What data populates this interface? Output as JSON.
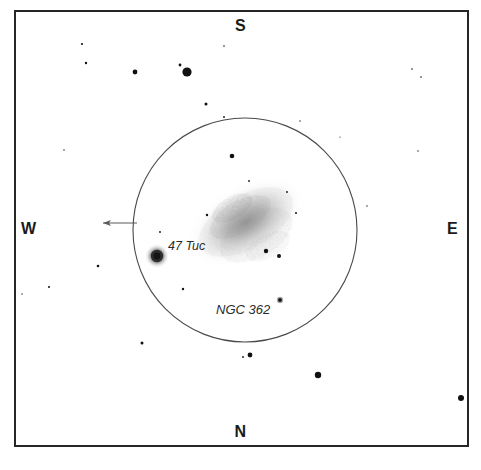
{
  "chart": {
    "type": "finder-chart",
    "background_color": "#ffffff",
    "ink_color": "#1a1a1a"
  },
  "frame": {
    "name": "chart-border",
    "x": 15,
    "y": 11,
    "width": 453,
    "height": 435,
    "stroke": "#262626",
    "stroke_width": 2
  },
  "cardinals": {
    "south": "S",
    "north": "N",
    "west": "W",
    "east": "E"
  },
  "fov_circle": {
    "name": "field-of-view-circle",
    "cx": 245,
    "cy": 230,
    "r": 112,
    "stroke": "#4a4a4a",
    "stroke_width": 1.1
  },
  "pointer_arrow": {
    "name": "west-direction-arrow",
    "x1": 137,
    "y1": 223,
    "x2": 101,
    "y2": 223,
    "stroke": "#5a5a5a",
    "stroke_width": 1.2
  },
  "labels": {
    "cluster_47tuc": "47 Tuc",
    "cluster_ngc362": "NGC 362"
  },
  "deep_sky_objects": [
    {
      "name": "47 Tuc",
      "cx": 157,
      "cy": 256,
      "r": 11,
      "kind": "globular-cluster"
    },
    {
      "name": "NGC 362",
      "cx": 280,
      "cy": 300,
      "r": 2.4,
      "kind": "globular-cluster"
    },
    {
      "name": "Small Magellanic Cloud",
      "cx": 246,
      "cy": 222,
      "rx": 62,
      "ry": 33,
      "angle": -30,
      "kind": "galaxy"
    }
  ],
  "chart_data": {
    "type": "scatter",
    "xlabel": "",
    "ylabel": "",
    "xlim": [
      15,
      468
    ],
    "ylim": [
      11,
      446
    ],
    "grid": false,
    "legend": "none",
    "annotations": [
      {
        "text": "S",
        "x": 241,
        "y": 26
      },
      {
        "text": "N",
        "x": 241,
        "y": 431
      },
      {
        "text": "W",
        "x": 28,
        "y": 228
      },
      {
        "text": "E",
        "x": 453,
        "y": 228
      },
      {
        "text": "47 Tuc",
        "x": 189,
        "y": 246
      },
      {
        "text": "NGC 362",
        "x": 248,
        "y": 310
      }
    ],
    "series": [
      {
        "name": "field stars",
        "marker": "circle",
        "color": "#111111",
        "points": [
          {
            "x": 82,
            "y": 44,
            "r": 1.1
          },
          {
            "x": 86,
            "y": 63,
            "r": 1.2
          },
          {
            "x": 135,
            "y": 72,
            "r": 2.4
          },
          {
            "x": 180,
            "y": 65,
            "r": 1.4
          },
          {
            "x": 187,
            "y": 72,
            "r": 4.6
          },
          {
            "x": 224,
            "y": 46,
            "r": 0.8
          },
          {
            "x": 224,
            "y": 117,
            "r": 0.9
          },
          {
            "x": 206,
            "y": 104,
            "r": 1.5
          },
          {
            "x": 412,
            "y": 69,
            "r": 0.8
          },
          {
            "x": 421,
            "y": 77,
            "r": 0.8
          },
          {
            "x": 418,
            "y": 151,
            "r": 0.7
          },
          {
            "x": 64,
            "y": 150,
            "r": 0.7
          },
          {
            "x": 98,
            "y": 266,
            "r": 1.3
          },
          {
            "x": 49,
            "y": 287,
            "r": 1.0
          },
          {
            "x": 22,
            "y": 294,
            "r": 0.7
          },
          {
            "x": 232,
            "y": 156,
            "r": 2.3
          },
          {
            "x": 249,
            "y": 181,
            "r": 0.9
          },
          {
            "x": 160,
            "y": 232,
            "r": 0.9
          },
          {
            "x": 142,
            "y": 343,
            "r": 1.5
          },
          {
            "x": 183,
            "y": 289,
            "r": 1.2
          },
          {
            "x": 243,
            "y": 357,
            "r": 0.9
          },
          {
            "x": 250,
            "y": 355,
            "r": 2.4
          },
          {
            "x": 318,
            "y": 375,
            "r": 3.2
          },
          {
            "x": 461,
            "y": 398,
            "r": 3.0
          },
          {
            "x": 300,
            "y": 121,
            "r": 0.7
          },
          {
            "x": 340,
            "y": 137,
            "r": 0.6
          },
          {
            "x": 367,
            "y": 206,
            "r": 0.7
          },
          {
            "x": 266,
            "y": 251,
            "r": 2.2
          },
          {
            "x": 279,
            "y": 256,
            "r": 2.0
          },
          {
            "x": 207,
            "y": 215,
            "r": 1.2
          },
          {
            "x": 296,
            "y": 213,
            "r": 1.0
          },
          {
            "x": 287,
            "y": 192,
            "r": 0.9
          }
        ]
      }
    ]
  }
}
